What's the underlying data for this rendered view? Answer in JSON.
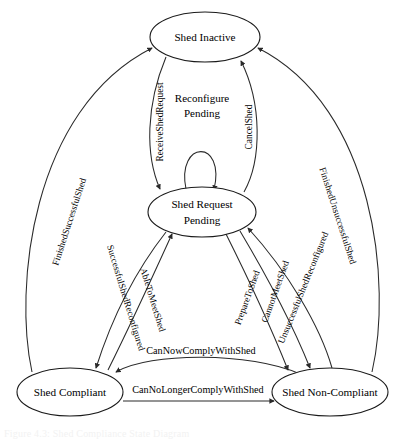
{
  "diagram": {
    "kind": "state-transition-diagram",
    "title_caption": "Figure 4.3: Shed Compliance State Diagram",
    "stroke_color": "#2a2a2a",
    "node_fill": "#ffffff",
    "nodes": [
      {
        "id": "shed-inactive",
        "label": "Shed Inactive",
        "cx": 205,
        "cy": 37,
        "rx": 55,
        "ry": 25
      },
      {
        "id": "shed-request-pending",
        "label_line1": "Shed Request",
        "label_line2": "Pending",
        "cx": 202,
        "cy": 212,
        "rx": 54,
        "ry": 25
      },
      {
        "id": "shed-compliant",
        "label": "Shed Compliant",
        "cx": 70,
        "cy": 392,
        "rx": 53,
        "ry": 24
      },
      {
        "id": "shed-non-compliant",
        "label": "Shed Non-Compliant",
        "cx": 330,
        "cy": 392,
        "rx": 58,
        "ry": 24
      }
    ],
    "edges": [
      {
        "id": "receive-shed-request",
        "label": "ReceiveShedRequest",
        "from": "shed-inactive",
        "to": "shed-request-pending",
        "orientation": "vertical-rotated"
      },
      {
        "id": "cancel-shed",
        "label": "CancelShed",
        "from": "shed-request-pending",
        "to": "shed-inactive",
        "orientation": "vertical-rotated"
      },
      {
        "id": "reconfigure-pending",
        "label": "Reconfigure Pending",
        "from": "shed-request-pending",
        "to": "shed-request-pending",
        "orientation": "self-loop"
      },
      {
        "id": "finished-successful-shed",
        "label": "FinishedSuccessfulShed",
        "from": "shed-compliant",
        "to": "shed-inactive",
        "orientation": "diagonal-rotated"
      },
      {
        "id": "finished-unsuccessful-shed",
        "label": "FinishedUnsuccessfulShed",
        "from": "shed-non-compliant",
        "to": "shed-inactive",
        "orientation": "diagonal-rotated"
      },
      {
        "id": "successful-shed-reconfigured",
        "label": "SuccessfulShedReconfigured",
        "from": "shed-request-pending",
        "to": "shed-compliant",
        "orientation": "diagonal-rotated"
      },
      {
        "id": "able-to-meet-shed",
        "label": "AbleToMeetShed",
        "from": "shed-compliant",
        "to": "shed-request-pending",
        "orientation": "diagonal-rotated"
      },
      {
        "id": "prepare-to-shed",
        "label": "PrepareToShed",
        "from": "shed-request-pending",
        "to": "shed-non-compliant",
        "orientation": "diagonal-rotated"
      },
      {
        "id": "cannot-meet-shed",
        "label": "CannotMeetShed",
        "from": "shed-request-pending",
        "to": "shed-non-compliant",
        "orientation": "diagonal-rotated"
      },
      {
        "id": "unsuccessful-shed-reconfigured",
        "label": "UnsuccessfulShedReconfigured",
        "from": "shed-non-compliant",
        "to": "shed-request-pending",
        "orientation": "diagonal-rotated"
      },
      {
        "id": "can-now-comply-with-shed",
        "label": "CanNowComplyWithShed",
        "from": "shed-non-compliant",
        "to": "shed-compliant",
        "orientation": "horizontal"
      },
      {
        "id": "can-no-longer-comply-with-shed",
        "label": "CanNoLongerComplyWithShed",
        "from": "shed-compliant",
        "to": "shed-non-compliant",
        "orientation": "horizontal"
      }
    ]
  }
}
